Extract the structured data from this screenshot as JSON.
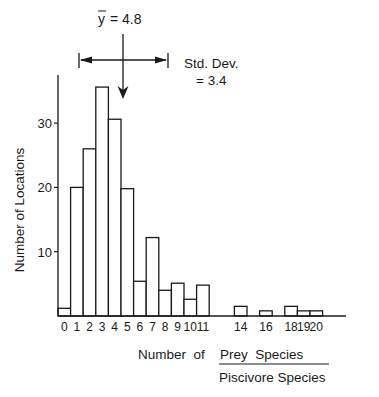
{
  "chart_data": {
    "type": "bar",
    "title": "",
    "xlabel": "Number of Prey Species / Piscivore Species",
    "xlabel_numerator": "Number of  Prey Species",
    "xlabel_prefix": "Number  of",
    "xlabel_top": "Prey  Species",
    "xlabel_bottom": "Piscivore Species",
    "ylabel": "Number  of  Locations",
    "ylim": [
      0,
      37
    ],
    "yticks": [
      10,
      20,
      30
    ],
    "grid": false,
    "legend": null,
    "categories": [
      "0",
      "1",
      "2",
      "3",
      "4",
      "5",
      "6",
      "7",
      "8",
      "9",
      "10",
      "11",
      "14",
      "16",
      "18",
      "19",
      "20"
    ],
    "x": [
      0,
      1,
      2,
      3,
      4,
      5,
      6,
      7,
      8,
      9,
      10,
      11,
      14,
      16,
      18,
      19,
      20
    ],
    "values": [
      1.2,
      20,
      26,
      35.6,
      30.6,
      19.8,
      5.4,
      12.2,
      4.0,
      5.1,
      2.6,
      4.8,
      1.5,
      0.8,
      1.5,
      0.8,
      0.8
    ],
    "xtick_labels": [
      {
        "x": 0,
        "label": "0"
      },
      {
        "x": 1,
        "label": "1"
      },
      {
        "x": 2,
        "label": "2"
      },
      {
        "x": 3,
        "label": "3"
      },
      {
        "x": 4,
        "label": "4"
      },
      {
        "x": 5,
        "label": "5"
      },
      {
        "x": 6,
        "label": "6"
      },
      {
        "x": 7,
        "label": "7"
      },
      {
        "x": 8,
        "label": "8"
      },
      {
        "x": 9,
        "label": "9"
      },
      {
        "x": 10,
        "label": "10"
      },
      {
        "x": 11,
        "label": "11"
      },
      {
        "x": 14,
        "label": "14"
      },
      {
        "x": 16,
        "label": "16"
      },
      {
        "x": 18,
        "label": "18"
      },
      {
        "x": 19,
        "label": "19"
      },
      {
        "x": 20,
        "label": "20"
      }
    ],
    "annotations": {
      "mean_label": "y = 4.8",
      "mean_symbol": "y",
      "mean_value_text": " = 4.8",
      "mean": 4.8,
      "sd_label_line1": "Std. Dev.",
      "sd_label_line2": "= 3.4",
      "sd": 3.4
    }
  }
}
